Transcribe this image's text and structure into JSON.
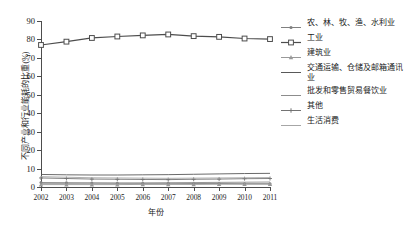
{
  "chart_data": {
    "type": "line",
    "title": "",
    "xlabel": "年份",
    "ylabel": "不同产业和行业能耗的比重(%)",
    "categories": [
      "2002",
      "2003",
      "2004",
      "2005",
      "2006",
      "2007",
      "2008",
      "2009",
      "2010",
      "2011"
    ],
    "xlim": [
      2002,
      2011
    ],
    "ylim": [
      0,
      90
    ],
    "yticks": [
      "0",
      "10",
      "20",
      "30",
      "40",
      "50",
      "60",
      "70",
      "80",
      "90"
    ],
    "grid": false,
    "legend_position": "right",
    "series": [
      {
        "name": "农、林、牧、渔、水利业",
        "marker": "dot",
        "color": "#808080",
        "values": [
          2.4,
          2.3,
          2.2,
          2.1,
          2.0,
          2.0,
          1.9,
          1.9,
          1.8,
          1.8
        ]
      },
      {
        "name": "工业",
        "marker": "square",
        "color": "#4d4d4d",
        "values": [
          77.0,
          78.8,
          80.8,
          81.6,
          82.2,
          82.7,
          81.8,
          81.4,
          80.5,
          80.2
        ]
      },
      {
        "name": "建筑业",
        "marker": "triangle",
        "color": "#999999",
        "values": [
          1.3,
          1.3,
          1.3,
          1.3,
          1.4,
          1.4,
          1.4,
          1.5,
          1.5,
          1.5
        ]
      },
      {
        "name": "交通运输、仓储及邮箱通讯业",
        "marker": "line",
        "color": "#595959",
        "values": [
          6.8,
          6.6,
          6.5,
          6.5,
          6.6,
          6.7,
          6.9,
          7.1,
          7.3,
          7.4
        ]
      },
      {
        "name": "批发和零售贸易餐饮业",
        "marker": "line",
        "color": "#8c8c8c",
        "values": [
          2.0,
          2.0,
          2.1,
          2.1,
          2.2,
          2.3,
          2.4,
          2.5,
          2.6,
          2.7
        ]
      },
      {
        "name": "其他",
        "marker": "cross",
        "color": "#737373",
        "values": [
          4.9,
          4.6,
          4.3,
          4.2,
          4.1,
          4.0,
          4.2,
          4.3,
          4.5,
          4.6
        ]
      },
      {
        "name": "生活消费",
        "marker": "line",
        "color": "#a6a6a6",
        "values": [
          5.6,
          5.3,
          5.0,
          4.9,
          4.8,
          4.7,
          4.8,
          4.9,
          5.0,
          5.1
        ]
      }
    ]
  }
}
